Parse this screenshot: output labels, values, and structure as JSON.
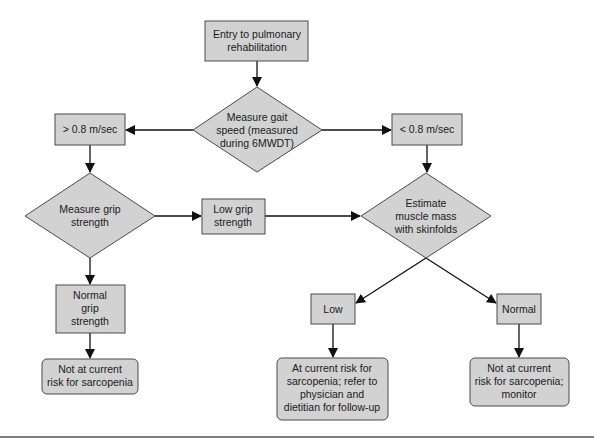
{
  "diagram": {
    "colors": {
      "node_fill": "#d2d2d2",
      "node_stroke": "#4a4a4a",
      "edge": "#111111",
      "text": "#1a1a1a"
    },
    "nodes": {
      "entry": {
        "shape": "rect",
        "lines": [
          "Entry to pulmonary",
          "rehabilitation"
        ]
      },
      "gait": {
        "shape": "diamond",
        "lines": [
          "Measure gait",
          "speed (measured",
          "during 6MWDT)"
        ]
      },
      "fast": {
        "shape": "rect",
        "lines": [
          "> 0.8 m/sec"
        ]
      },
      "slow": {
        "shape": "rect",
        "lines": [
          "< 0.8 m/sec"
        ]
      },
      "grip": {
        "shape": "diamond",
        "lines": [
          "Measure grip",
          "strength"
        ]
      },
      "low_grip": {
        "shape": "rect",
        "lines": [
          "Low grip",
          "strength"
        ]
      },
      "skinfolds": {
        "shape": "diamond",
        "lines": [
          "Estimate",
          "muscle mass",
          "with skinfolds"
        ]
      },
      "normal_grip": {
        "shape": "rect",
        "lines": [
          "Normal",
          "grip",
          "strength"
        ]
      },
      "low_mass": {
        "shape": "rect",
        "lines": [
          "Low"
        ]
      },
      "normal_mass": {
        "shape": "rect",
        "lines": [
          "Normal"
        ]
      },
      "outcome_not_risk": {
        "shape": "rounded-rect",
        "lines": [
          "Not at current",
          "risk for sarcopenia"
        ]
      },
      "outcome_at_risk": {
        "shape": "rounded-rect",
        "lines": [
          "At current risk for",
          "sarcopenia; refer to",
          "physician and",
          "dietitian for follow-up"
        ]
      },
      "outcome_monitor": {
        "shape": "rounded-rect",
        "lines": [
          "Not at current",
          "risk for sarcopenia;",
          "monitor"
        ]
      }
    },
    "edges": [
      {
        "from": "entry",
        "to": "gait"
      },
      {
        "from": "gait",
        "to": "fast"
      },
      {
        "from": "gait",
        "to": "slow"
      },
      {
        "from": "fast",
        "to": "grip"
      },
      {
        "from": "slow",
        "to": "skinfolds"
      },
      {
        "from": "grip",
        "to": "low_grip"
      },
      {
        "from": "low_grip",
        "to": "skinfolds"
      },
      {
        "from": "grip",
        "to": "normal_grip"
      },
      {
        "from": "normal_grip",
        "to": "outcome_not_risk"
      },
      {
        "from": "skinfolds",
        "to": "low_mass"
      },
      {
        "from": "skinfolds",
        "to": "normal_mass"
      },
      {
        "from": "low_mass",
        "to": "outcome_at_risk"
      },
      {
        "from": "normal_mass",
        "to": "outcome_monitor"
      }
    ]
  }
}
